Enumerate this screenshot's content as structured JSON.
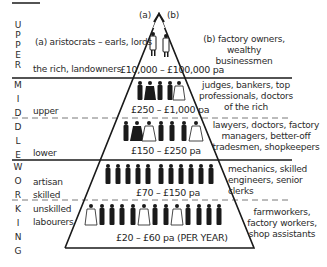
{
  "diagram": {
    "type": "social class pyramid",
    "colors": {
      "ink": "#1a1a1a",
      "background": "#ffffff"
    },
    "vertical_labels": {
      "upper": [
        "U",
        "P",
        "P",
        "E",
        "R"
      ],
      "middle": [
        "M",
        "I",
        "D",
        "D",
        "L",
        "E"
      ],
      "working": [
        "W",
        "O",
        "R",
        "K",
        "I",
        "N",
        "G"
      ]
    },
    "classes": {
      "upper": {
        "left_label_a": "(a) aristocrats – earls, lords",
        "left_label_b": "the rich, landowners",
        "marker_a": "(a)",
        "marker_b": "(b)",
        "right_desc_line1": "(b) factory owners, wealthy",
        "right_desc_line2": "businessmen",
        "income": "£10,000 – £100,000 pa"
      },
      "upper_middle": {
        "left_label": "upper",
        "right_desc_line1": "judges, bankers, top",
        "right_desc_line2": "professionals, doctors",
        "right_desc_line3": "of the rich",
        "income": "£250 – £1,000 pa"
      },
      "lower_middle": {
        "left_label": "lower",
        "right_desc_line1": "lawyers, doctors, factory",
        "right_desc_line2": "managers, better-off",
        "right_desc_line3": "tradesmen, shopkeepers",
        "income": "£150 – £250 pa"
      },
      "skilled_working": {
        "left_label_line1": "artisan",
        "left_label_line2": "skilled",
        "right_desc_line1": "mechanics, skilled",
        "right_desc_line2": "engineers, senior",
        "right_desc_line3": "clerks",
        "income": "£70 – £150 pa"
      },
      "unskilled_working": {
        "left_label_line1": "unskilled",
        "left_label_line2": "labourers",
        "right_desc_line1": "farmworkers,",
        "right_desc_line2": "factory workers,",
        "right_desc_line3": "shop assistants",
        "income": "£20 – £60 pa (PER YEAR)"
      }
    },
    "figure_icon": "person-figure-icon"
  }
}
